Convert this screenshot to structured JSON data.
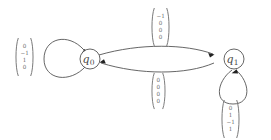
{
  "diagram": {
    "type": "state-transition-diagram",
    "states": [
      {
        "id": "q0",
        "label": "q",
        "subscript": "0"
      },
      {
        "id": "q1",
        "label": "q",
        "subscript": "1"
      }
    ],
    "transitions": [
      {
        "id": "loop-q0",
        "from": "q0",
        "to": "q0",
        "shape": "self-loop-left",
        "label_vector": [
          "0",
          "−1",
          "1",
          "0"
        ]
      },
      {
        "id": "q0-to-q1",
        "from": "q0",
        "to": "q1",
        "shape": "curve-top",
        "label_vector": [
          "−1",
          "0",
          "0",
          "0"
        ]
      },
      {
        "id": "q1-to-q0",
        "from": "q1",
        "to": "q0",
        "shape": "curve-bottom",
        "label_vector": [
          "0",
          "0",
          "0",
          "0"
        ]
      },
      {
        "id": "loop-q1",
        "from": "q1",
        "to": "q1",
        "shape": "self-loop-bottom",
        "label_vector": [
          "0",
          "1",
          "−1",
          "1"
        ]
      }
    ],
    "colors": {
      "stroke": "#555555",
      "arrow": "#222222",
      "text": "#6b6b6b",
      "background": "#ffffff"
    }
  }
}
